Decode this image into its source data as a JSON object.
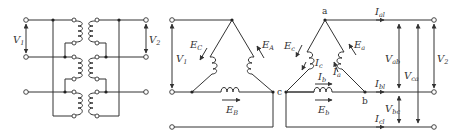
{
  "figure": {
    "left_panel": {
      "primary_voltage": {
        "main": "V",
        "sub": "1"
      },
      "secondary_voltage": {
        "main": "V",
        "sub": "2"
      }
    },
    "primary_delta": {
      "voltage": {
        "main": "V",
        "sub": "1"
      },
      "emf_A": {
        "main": "E",
        "sub": "A"
      },
      "emf_B": {
        "main": "E",
        "sub": "B"
      },
      "emf_C": {
        "main": "E",
        "sub": "C"
      },
      "node_c": "c"
    },
    "secondary_delta": {
      "node_a": "a",
      "node_b": "b",
      "emf_a": {
        "main": "E",
        "sub": "a"
      },
      "emf_b": {
        "main": "E",
        "sub": "b"
      },
      "emf_c": {
        "main": "E",
        "sub": "c"
      },
      "current_a": {
        "main": "I",
        "sub": "a"
      },
      "current_b": {
        "main": "I",
        "sub": "b"
      },
      "current_c": {
        "main": "I",
        "sub": "c"
      },
      "line_current_a": {
        "main": "I",
        "sub": "al"
      },
      "line_current_b": {
        "main": "I",
        "sub": "bl"
      },
      "line_current_c": {
        "main": "I",
        "sub": "cl"
      },
      "voltage_ab": {
        "main": "V",
        "sub": "ab"
      },
      "voltage_bc": {
        "main": "V",
        "sub": "bc"
      },
      "voltage_ca": {
        "main": "V",
        "sub": "ca"
      },
      "voltage_2": {
        "main": "V",
        "sub": "2"
      }
    }
  }
}
